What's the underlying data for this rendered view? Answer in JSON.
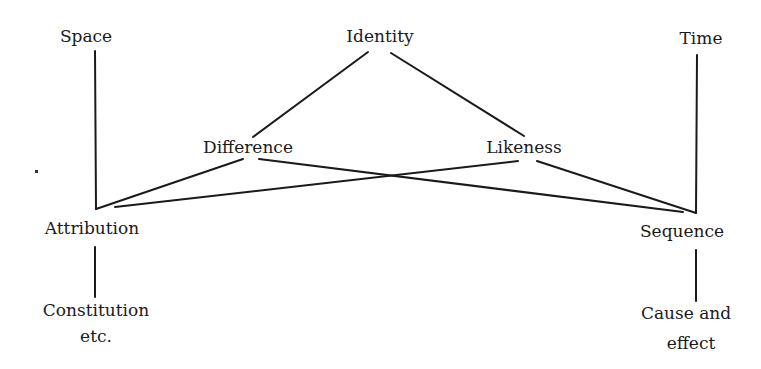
{
  "diagram": {
    "type": "concept-graph",
    "nodes": [
      {
        "id": "space",
        "label": "Space",
        "line2": ""
      },
      {
        "id": "identity",
        "label": "Identity",
        "line2": ""
      },
      {
        "id": "time",
        "label": "Time",
        "line2": ""
      },
      {
        "id": "difference",
        "label": "Difference",
        "line2": ""
      },
      {
        "id": "likeness",
        "label": "Likeness",
        "line2": ""
      },
      {
        "id": "attribution",
        "label": "Attribution",
        "line2": ""
      },
      {
        "id": "sequence",
        "label": "Sequence",
        "line2": ""
      },
      {
        "id": "constitution",
        "label": "Constitution",
        "line2": "etc."
      },
      {
        "id": "cause",
        "label": "Cause and",
        "line2": "effect"
      }
    ],
    "edges": [
      [
        "identity",
        "difference"
      ],
      [
        "identity",
        "likeness"
      ],
      [
        "space",
        "attribution"
      ],
      [
        "time",
        "sequence"
      ],
      [
        "difference",
        "attribution"
      ],
      [
        "difference",
        "sequence"
      ],
      [
        "likeness",
        "attribution"
      ],
      [
        "likeness",
        "sequence"
      ],
      [
        "attribution",
        "constitution"
      ],
      [
        "sequence",
        "cause"
      ]
    ]
  }
}
